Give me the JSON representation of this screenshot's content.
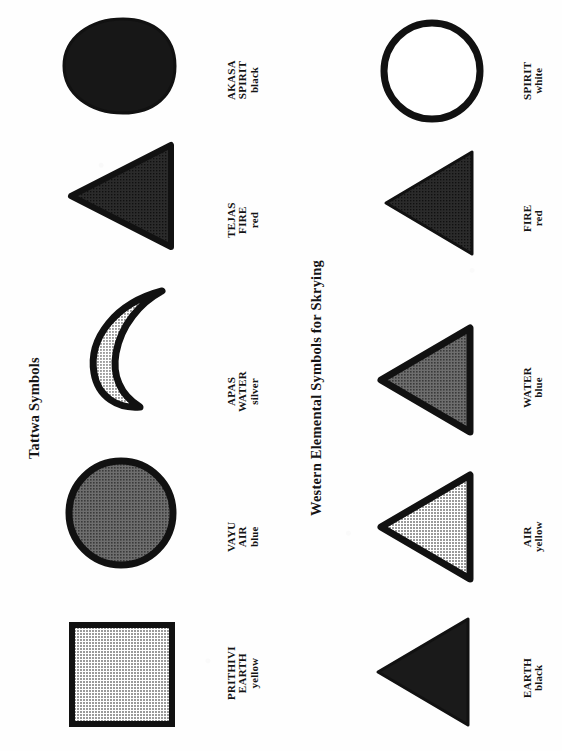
{
  "page": {
    "background_color": "#fefefe",
    "orientation": "rotated-90-ccw",
    "ink_color": "#141414"
  },
  "sections": [
    {
      "id": "tattwa",
      "title": "Tattwa Symbols",
      "items": [
        {
          "sanskrit_name": "PRITHIVI",
          "element": "EARTH",
          "color_name": "yellow",
          "shape": "square",
          "fill_hex": "#a8a8a8",
          "stroke_hex": "#111111"
        },
        {
          "sanskrit_name": "VAYU",
          "element": "AIR",
          "color_name": "blue",
          "shape": "circle",
          "fill_hex": "#555555",
          "stroke_hex": "#111111"
        },
        {
          "sanskrit_name": "APAS",
          "element": "WATER",
          "color_name": "silver",
          "shape": "crescent",
          "fill_hex": "#b4b4b4",
          "stroke_hex": "#111111"
        },
        {
          "sanskrit_name": "TEJAS",
          "element": "FIRE",
          "color_name": "red",
          "shape": "triangle",
          "fill_hex": "#2b2b2b",
          "stroke_hex": "#111111"
        },
        {
          "sanskrit_name": "AKASA",
          "element": "SPIRIT",
          "color_name": "black",
          "shape": "egg",
          "fill_hex": "#171717",
          "stroke_hex": "#111111"
        }
      ]
    },
    {
      "id": "western",
      "title": "Western Elemental Symbols for Skrying",
      "items": [
        {
          "sanskrit_name": "",
          "element": "EARTH",
          "color_name": "black",
          "shape": "triangle",
          "fill_hex": "#1a1a1a",
          "stroke_hex": "#111111"
        },
        {
          "sanskrit_name": "",
          "element": "AIR",
          "color_name": "yellow",
          "shape": "triangle",
          "fill_hex": "#b0b0b0",
          "stroke_hex": "#111111"
        },
        {
          "sanskrit_name": "",
          "element": "WATER",
          "color_name": "blue",
          "shape": "triangle",
          "fill_hex": "#5a5a5a",
          "stroke_hex": "#111111"
        },
        {
          "sanskrit_name": "",
          "element": "FIRE",
          "color_name": "red",
          "shape": "triangle",
          "fill_hex": "#262626",
          "stroke_hex": "#111111"
        },
        {
          "sanskrit_name": "",
          "element": "SPIRIT",
          "color_name": "white",
          "shape": "circle-outline",
          "fill_hex": "#ffffff",
          "stroke_hex": "#111111"
        }
      ]
    }
  ]
}
